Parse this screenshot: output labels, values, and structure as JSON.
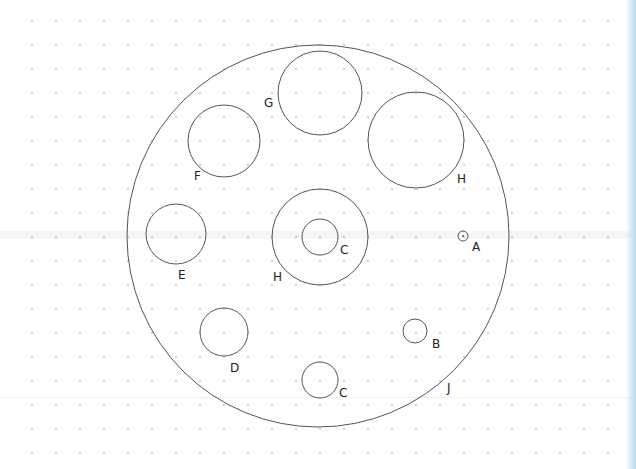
{
  "diagram": {
    "background": "#ffffff",
    "stroke_color": "#555555",
    "grid": {
      "type": "dot",
      "origin_x": 32,
      "origin_y": 21,
      "spacing": 24,
      "cols": 25,
      "rows": 19,
      "dot_color": "#9a9a9a"
    },
    "outer_circle": {
      "label": "J",
      "cx": 318,
      "cy": 236,
      "r": 191,
      "label_x": 447,
      "label_y": 392
    },
    "circles": [
      {
        "id": "G",
        "label": "G",
        "cx": 320,
        "cy": 93,
        "r": 42,
        "label_x": 264,
        "label_y": 107
      },
      {
        "id": "H-right",
        "label": "H",
        "cx": 416,
        "cy": 140,
        "r": 48,
        "label_x": 457,
        "label_y": 183
      },
      {
        "id": "F",
        "label": "F",
        "cx": 224,
        "cy": 141,
        "r": 36,
        "label_x": 194,
        "label_y": 180
      },
      {
        "id": "E",
        "label": "E",
        "cx": 176,
        "cy": 234,
        "r": 30,
        "label_x": 178,
        "label_y": 279
      },
      {
        "id": "H-center",
        "label": "H",
        "cx": 320,
        "cy": 237,
        "r": 48,
        "label_x": 273,
        "label_y": 281
      },
      {
        "id": "C-center",
        "label": "C",
        "cx": 320,
        "cy": 237,
        "r": 18,
        "label_x": 340,
        "label_y": 254
      },
      {
        "id": "A",
        "label": "A",
        "cx": 463,
        "cy": 236,
        "r": 5,
        "label_x": 472,
        "label_y": 251,
        "center_dot": true
      },
      {
        "id": "D",
        "label": "D",
        "cx": 224,
        "cy": 332,
        "r": 24,
        "label_x": 230,
        "label_y": 372
      },
      {
        "id": "B",
        "label": "B",
        "cx": 415,
        "cy": 331,
        "r": 12,
        "label_x": 432,
        "label_y": 348
      },
      {
        "id": "C-bottom",
        "label": "C",
        "cx": 320,
        "cy": 380,
        "r": 18,
        "label_x": 339,
        "label_y": 397
      }
    ]
  }
}
